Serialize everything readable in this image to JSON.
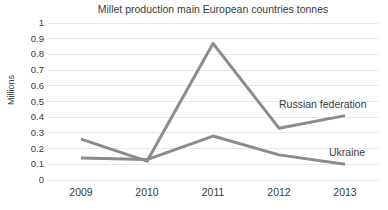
{
  "chart_data": {
    "type": "line",
    "title": "Millet production main European countries tonnes",
    "xlabel": "",
    "ylabel": "Millions",
    "categories": [
      "2009",
      "2010",
      "2011",
      "2012",
      "2013"
    ],
    "series": [
      {
        "name": "Russian federation",
        "values": [
          0.26,
          0.12,
          0.87,
          0.33,
          0.41
        ],
        "color": "#8c8c8c"
      },
      {
        "name": "Ukraine",
        "values": [
          0.14,
          0.13,
          0.28,
          0.16,
          0.1
        ],
        "color": "#8c8c8c"
      }
    ],
    "ylim": [
      0,
      1
    ],
    "ytick_step": 0.1,
    "ytick_labels": [
      "1",
      "0.9",
      "0.8",
      "0.7",
      "0.6",
      "0.5",
      "0.4",
      "0.3",
      "0.2",
      "0.1",
      "0"
    ],
    "grid": "horizontal",
    "gridline_color": "#e8e8e8",
    "legend_position": "inline-series-labels",
    "background_color": "#ffffff",
    "text_color": "#3a3a3a"
  }
}
